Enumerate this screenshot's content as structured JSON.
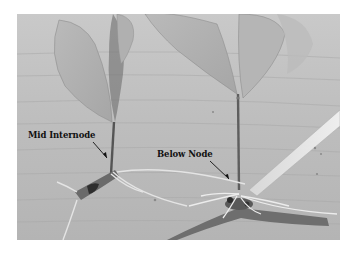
{
  "figure": {
    "annotations": [
      {
        "id": "mid-internode",
        "text": "Mid Internode"
      },
      {
        "id": "below-node",
        "text": "Below Node"
      }
    ]
  }
}
